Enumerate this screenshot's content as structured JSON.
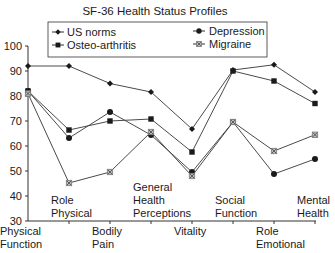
{
  "chart_data": {
    "type": "line",
    "title": "SF-36 Health Status Profiles",
    "xlabel": "",
    "ylabel": "",
    "ylim": [
      30,
      100
    ],
    "yticks": [
      30,
      40,
      50,
      60,
      70,
      80,
      90,
      100
    ],
    "grid": false,
    "legend_position": "top",
    "categories": [
      "Physical Function",
      "Role Physical",
      "Bodily Pain",
      "General Health Perceptions",
      "Vitality",
      "Social Function",
      "Role Emotional",
      "Mental Health"
    ],
    "category_label_lines": [
      [
        "Physical",
        "Function"
      ],
      [
        "Role",
        "Physical"
      ],
      [
        "Bodily",
        "Pain"
      ],
      [
        "General",
        "Health",
        "Perceptions"
      ],
      [
        "Vitality"
      ],
      [
        "Social",
        "Function"
      ],
      [
        "Role",
        "Emotional"
      ],
      [
        "Mental",
        "Health"
      ]
    ],
    "series": [
      {
        "name": "US norms",
        "marker": "diamond",
        "values": [
          92,
          92,
          85,
          81.6,
          66.8,
          90.4,
          92.5,
          81.6
        ]
      },
      {
        "name": "Osteo-arthritis",
        "marker": "square",
        "values": [
          82,
          66.4,
          70,
          70.8,
          57.6,
          90,
          86,
          77
        ]
      },
      {
        "name": "Depression",
        "marker": "circle",
        "values": [
          82,
          63.2,
          73.6,
          64.4,
          49.6,
          69.6,
          48.8,
          54.8
        ]
      },
      {
        "name": "Migraine",
        "marker": "asterisk-square",
        "values": [
          81,
          45.2,
          49.6,
          65.6,
          48,
          69.6,
          58,
          64.5
        ]
      }
    ]
  },
  "legend": {
    "items": [
      {
        "label": "US norms",
        "marker": "diamond"
      },
      {
        "label": "Osteo-arthritis",
        "marker": "square"
      },
      {
        "label": "Depression",
        "marker": "circle"
      },
      {
        "label": "Migraine",
        "marker": "asterisk-square"
      }
    ]
  },
  "colors": {
    "line": "#4a4a4a",
    "marker": "#1a1a1a",
    "axis": "#333333",
    "text": "#1a1a1a",
    "migraine_marker": "#777777"
  }
}
